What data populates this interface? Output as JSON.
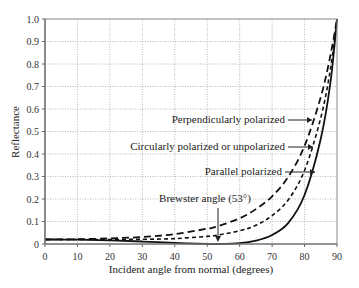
{
  "chart_data": {
    "type": "line",
    "title": "",
    "xlabel": "Incident angle from normal (degrees)",
    "ylabel": "Reflectance",
    "xlim": [
      0,
      90
    ],
    "ylim": [
      0,
      1.0
    ],
    "grid": true,
    "xticks": [
      0,
      10,
      20,
      30,
      40,
      50,
      60,
      70,
      80,
      90
    ],
    "yticks": [
      0,
      0.1,
      0.2,
      0.3,
      0.4,
      0.5,
      0.6,
      0.7,
      0.8,
      0.9,
      1.0
    ],
    "ytick_labels": [
      "0",
      "0.1",
      "0.2",
      "0.3",
      "0.4",
      "0.5",
      "0.6",
      "0.7",
      "0.8",
      "0.9",
      "1.0"
    ],
    "x": [
      0,
      10,
      20,
      30,
      40,
      50,
      53,
      60,
      65,
      70,
      75,
      80,
      85,
      88,
      90
    ],
    "series": [
      {
        "name": "Perpendicularly polarized",
        "style": "long-dash",
        "values": [
          0.02,
          0.021,
          0.025,
          0.031,
          0.044,
          0.068,
          0.078,
          0.114,
          0.155,
          0.212,
          0.299,
          0.436,
          0.653,
          0.84,
          1.0
        ]
      },
      {
        "name": "Circularly polarized or unpolarized",
        "style": "short-dash",
        "values": [
          0.02,
          0.02,
          0.02,
          0.021,
          0.024,
          0.034,
          0.039,
          0.059,
          0.083,
          0.126,
          0.197,
          0.327,
          0.561,
          0.78,
          1.0
        ]
      },
      {
        "name": "Parallel polarized",
        "style": "solid",
        "values": [
          0.02,
          0.019,
          0.016,
          0.011,
          0.005,
          0.0002,
          0.0,
          0.004,
          0.015,
          0.04,
          0.094,
          0.218,
          0.468,
          0.72,
          1.0
        ]
      }
    ],
    "annotations": [
      {
        "text": "Perpendicularly polarized",
        "arrow_to": [
          83,
          0.57
        ]
      },
      {
        "text": "Circularly polarized or unpolarized",
        "arrow_to": [
          83.5,
          0.47
        ]
      },
      {
        "text": "Parallel polarized",
        "arrow_to": [
          85,
          0.4
        ]
      },
      {
        "text": "Brewster angle (53°)",
        "arrow_to": [
          53,
          0.0
        ]
      }
    ],
    "legend": "none (inline annotations with arrows)"
  }
}
